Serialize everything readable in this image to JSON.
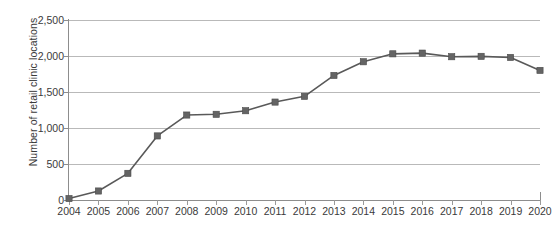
{
  "chart_data": {
    "type": "line",
    "title": "",
    "xlabel": "",
    "ylabel": "Number of retail clinic locations",
    "categories": [
      "2004",
      "2005",
      "2006",
      "2007",
      "2008",
      "2009",
      "2010",
      "2011",
      "2012",
      "2013",
      "2014",
      "2015",
      "2016",
      "2017",
      "2018",
      "2019",
      "2020"
    ],
    "values": [
      20,
      125,
      370,
      890,
      1180,
      1190,
      1240,
      1360,
      1440,
      1730,
      1920,
      2030,
      2040,
      1990,
      1995,
      1980,
      1800
    ],
    "series": [
      {
        "name": "Number of retail clinic locations",
        "values": [
          20,
          125,
          370,
          890,
          1180,
          1190,
          1240,
          1360,
          1440,
          1730,
          1920,
          2030,
          2040,
          1990,
          1995,
          1980,
          1800
        ]
      }
    ],
    "ylim": [
      0,
      2500
    ],
    "y_ticks": [
      0,
      500,
      1000,
      1500,
      2000,
      2500
    ],
    "y_tick_labels": [
      "0",
      "500",
      "1,000",
      "1,500",
      "2,000",
      "2,500"
    ],
    "grid": "horizontal",
    "legend": "none",
    "marker": "square",
    "line_color": "#595959",
    "marker_color": "#646464",
    "grid_color": "#b9b9b9",
    "axis_color": "#8d8d8d",
    "background_color": "#ffffff"
  }
}
